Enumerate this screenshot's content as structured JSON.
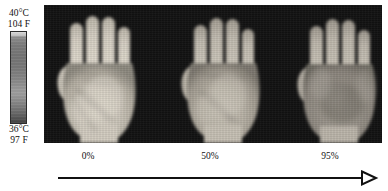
{
  "colorbar": {
    "name": "temperature-scale",
    "max_celsius": "40°C",
    "max_fahrenheit": "104 F",
    "min_celsius": "36°C",
    "min_fahrenheit": "97 F",
    "orientation": "vertical",
    "colormap": "grayscale",
    "top_color": "#d9d9d9",
    "bottom_color": "#434343"
  },
  "thermal_panel": {
    "background_color": "#121212",
    "image_count": 3,
    "modality": "infrared-thermography",
    "subject": "hand-palm",
    "images": [
      {
        "label": "0%",
        "name": "thermal-hand-0",
        "relative_warmth": "warmest",
        "skin_tone": "#cfc9bd",
        "description": "bright warm palm with visible vein pattern"
      },
      {
        "label": "50%",
        "name": "thermal-hand-1",
        "relative_warmth": "intermediate",
        "skin_tone": "#bcb6aa",
        "description": "moderately warm palm, reduced contrast"
      },
      {
        "label": "95%",
        "name": "thermal-hand-2",
        "relative_warmth": "coolest",
        "skin_tone": "#a39d93",
        "description": "cooler palm with darker central region"
      }
    ]
  },
  "axis": {
    "labels": [
      "0%",
      "50%",
      "95%"
    ],
    "arrow_direction": "right",
    "arrow_style": "open-triangle-head",
    "arrow_color": "#111111"
  }
}
